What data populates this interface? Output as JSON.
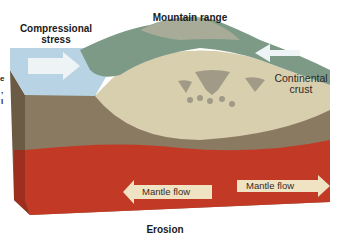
{
  "diagram": {
    "labels": {
      "compressional_stress": [
        "Compressional",
        "stress"
      ],
      "mountain_range": "Mountain range",
      "continental_crust": [
        "Continental",
        "crust"
      ],
      "mantle_flow_left": "Mantle flow",
      "mantle_flow_right": "Mantle flow",
      "erosion": "Erosion"
    },
    "edge_fragments": [
      "e",
      ",",
      "l"
    ],
    "colors": {
      "ocean": "#b8d4e4",
      "crust": "#d8cfae",
      "lithosphere": "#8a7a62",
      "mantle": "#c23a26",
      "arrow": "#f0e3c4",
      "mountain": "#7d9a86"
    }
  }
}
